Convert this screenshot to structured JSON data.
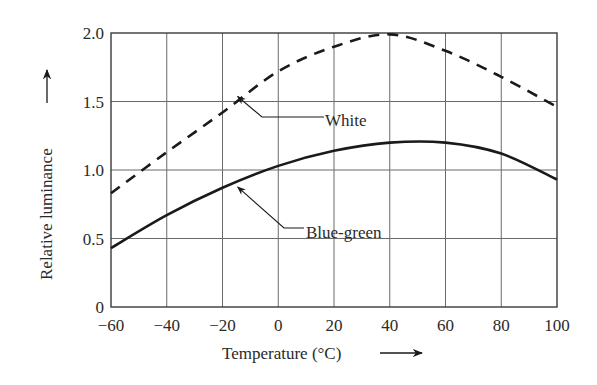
{
  "chart_data": {
    "type": "line",
    "title": "",
    "xlabel": "Temperature (°C)",
    "ylabel": "Relative luminance",
    "xlim": [
      -60,
      100
    ],
    "ylim": [
      0,
      2.0
    ],
    "grid": true,
    "legend": "inline annotations with arrows",
    "x_ticks": [
      "-60",
      "-40",
      "-20",
      "0",
      "20",
      "40",
      "60",
      "80",
      "100"
    ],
    "x_tick_labels": [
      "−60",
      "−40",
      "−20",
      "0",
      "20",
      "40",
      "60",
      "80",
      "100"
    ],
    "y_ticks": [
      "0",
      "0.5",
      "1.0",
      "1.5",
      "2.0"
    ],
    "x": [
      -60,
      -40,
      -20,
      0,
      20,
      40,
      60,
      80,
      100
    ],
    "series": [
      {
        "name": "White",
        "style": "dashed",
        "values": [
          0.83,
          1.13,
          1.42,
          1.72,
          1.9,
          1.99,
          1.87,
          1.68,
          1.46
        ]
      },
      {
        "name": "Blue-green",
        "style": "solid",
        "values": [
          0.43,
          0.67,
          0.87,
          1.03,
          1.14,
          1.2,
          1.2,
          1.12,
          0.93
        ]
      }
    ],
    "annotations": [
      {
        "text": "White",
        "points_to": {
          "x": -16,
          "y": 1.58
        }
      },
      {
        "text": "Blue-green",
        "points_to": {
          "x": -16,
          "y": 0.92
        }
      }
    ]
  },
  "colors": {
    "line": "#1a1a1a",
    "grid": "#6a6a6a",
    "text": "#2a2a2a",
    "background": "#ffffff"
  }
}
